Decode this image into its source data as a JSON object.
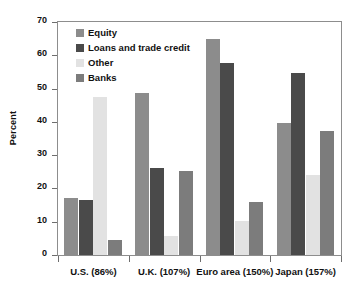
{
  "chart_data": {
    "type": "bar",
    "title": "",
    "xlabel": "",
    "ylabel": "Percent",
    "ylim": [
      0,
      70
    ],
    "yticks": [
      0,
      10,
      20,
      30,
      40,
      50,
      60,
      70
    ],
    "grid": false,
    "legend_position": "top-left",
    "categories": [
      "U.S. (86%)",
      "U.K. (107%)",
      "Euro area (150%)",
      "Japan (157%)"
    ],
    "series": [
      {
        "name": "Equity",
        "color": "#8c8c8c",
        "values": [
          17.0,
          48.6,
          65.0,
          39.6
        ]
      },
      {
        "name": "Loans and trade credit",
        "color": "#4a4a4a",
        "values": [
          16.6,
          26.2,
          57.7,
          54.8
        ]
      },
      {
        "name": "Other",
        "color": "#e2e2e2",
        "values": [
          47.6,
          5.8,
          10.3,
          24.0
        ]
      },
      {
        "name": "Banks",
        "color": "#7c7c7c",
        "values": [
          4.5,
          25.2,
          16.0,
          37.3
        ]
      }
    ]
  },
  "axis": {
    "y_title": "Percent",
    "y_tick_labels": [
      "0",
      "10",
      "20",
      "30",
      "40",
      "50",
      "60",
      "70"
    ]
  },
  "legend": {
    "items": [
      {
        "label": "Equity"
      },
      {
        "label": "Loans and trade credit"
      },
      {
        "label": "Other"
      },
      {
        "label": "Banks"
      }
    ]
  }
}
